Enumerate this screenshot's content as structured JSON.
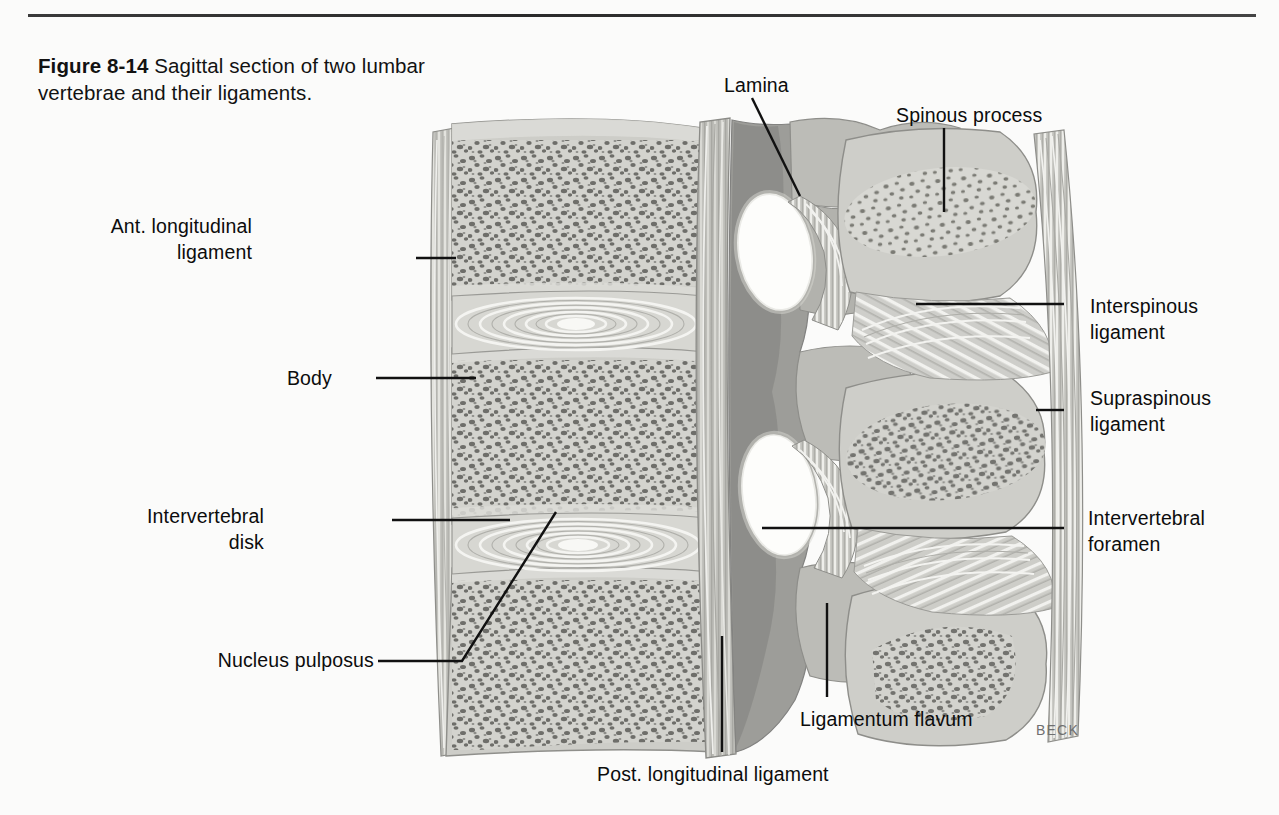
{
  "page": {
    "background": "#fbfbfa",
    "rule_color": "#2f2f2f",
    "signature": "BECK"
  },
  "caption": {
    "figure_number": "Figure 8-14",
    "text": "  Sagittal section of two lumbar vertebrae and their ligaments."
  },
  "illustration": {
    "title": "Sagittal section of two lumbar vertebrae and their ligaments",
    "palette": {
      "bone_fill": "#c9c9c4",
      "bone_light": "#dcdcd7",
      "cancellous_speck": "#6b6b68",
      "disk_fill": "#d6d6d1",
      "annulus_line": "#f4f4f1",
      "nucleus": "#f6f6f3",
      "foramen": "#fdfdfb",
      "ligament_dark": "#8e8e8a",
      "outline": "#8a8a86"
    },
    "structures": [
      "anterior longitudinal ligament",
      "vertebral body (upper)",
      "intervertebral disk (upper)",
      "vertebral body (middle)",
      "intervertebral disk (lower)",
      "vertebral body (lower)",
      "posterior longitudinal ligament",
      "intervertebral foramen (upper)",
      "intervertebral foramen (lower)",
      "lamina",
      "spinous process (upper)",
      "spinous process (middle)",
      "spinous process (lower)",
      "interspinous ligament",
      "supraspinous ligament",
      "ligamentum flavum"
    ]
  },
  "labels": [
    {
      "id": "ant-longitudinal-ligament",
      "text": "Ant. longitudinal\nligament",
      "align": "right",
      "x": 252,
      "y": 216
    },
    {
      "id": "body",
      "text": "Body",
      "align": "right",
      "x": 332,
      "y": 366
    },
    {
      "id": "intervertebral-disk",
      "text": "Intervertebral\ndisk",
      "align": "right",
      "x": 264,
      "y": 506
    },
    {
      "id": "nucleus-pulposus",
      "text": "Nucleus  pulposus",
      "align": "right",
      "x": 208,
      "y": 648
    },
    {
      "id": "lamina",
      "text": "Lamina",
      "align": "left",
      "x": 724,
      "y": 74
    },
    {
      "id": "spinous-process",
      "text": "Spinous process",
      "align": "left",
      "x": 896,
      "y": 104
    },
    {
      "id": "interspinous-ligament",
      "text": "Interspinous\nligament",
      "align": "left",
      "x": 1090,
      "y": 296
    },
    {
      "id": "supraspinous-ligament",
      "text": "Supraspinous\nligament",
      "align": "left",
      "x": 1090,
      "y": 388
    },
    {
      "id": "intervertebral-foramen",
      "text": "Intervertebral\nforamen",
      "align": "left",
      "x": 1088,
      "y": 508
    },
    {
      "id": "ligamentum-flavum",
      "text": "Ligamentum flavum",
      "align": "left",
      "x": 800,
      "y": 708
    },
    {
      "id": "post-longitudinal-ligament",
      "text": "Post. longitudinal ligament",
      "align": "left",
      "x": 597,
      "y": 763
    }
  ]
}
